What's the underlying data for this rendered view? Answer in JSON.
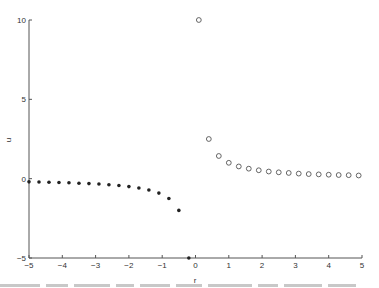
{
  "chart_data": {
    "type": "scatter",
    "title": "",
    "xlabel": "r",
    "ylabel": "u",
    "xlim": [
      -5,
      5
    ],
    "ylim": [
      -5,
      10
    ],
    "xticks": [
      -5,
      -4,
      -3,
      -2,
      -1,
      0,
      1,
      2,
      3,
      4,
      5
    ],
    "yticks": [
      -5,
      0,
      5,
      10
    ],
    "grid": false,
    "legend": null,
    "series": [
      {
        "name": "r < 0",
        "marker": "filled-dot",
        "color": "#222222",
        "x": [
          -5.0,
          -4.7,
          -4.4,
          -4.1,
          -3.8,
          -3.5,
          -3.2,
          -2.9,
          -2.6,
          -2.3,
          -2.0,
          -1.7,
          -1.4,
          -1.1,
          -0.8,
          -0.5,
          -0.2
        ],
        "y": [
          -0.2,
          -0.21,
          -0.23,
          -0.24,
          -0.26,
          -0.29,
          -0.31,
          -0.34,
          -0.38,
          -0.43,
          -0.5,
          -0.59,
          -0.71,
          -0.91,
          -1.25,
          -2.0,
          -5.0
        ]
      },
      {
        "name": "r > 0",
        "marker": "hollow-circle",
        "color": "#555555",
        "x": [
          0.1,
          0.4,
          0.7,
          1.0,
          1.3,
          1.6,
          1.9,
          2.2,
          2.5,
          2.8,
          3.1,
          3.4,
          3.7,
          4.0,
          4.3,
          4.6,
          4.9
        ],
        "y": [
          10.0,
          2.5,
          1.43,
          1.0,
          0.77,
          0.63,
          0.53,
          0.45,
          0.4,
          0.36,
          0.32,
          0.29,
          0.27,
          0.25,
          0.23,
          0.22,
          0.2
        ]
      }
    ]
  },
  "layout": {
    "x_px": [
      29,
      362
    ],
    "y_px": [
      258,
      20
    ]
  }
}
